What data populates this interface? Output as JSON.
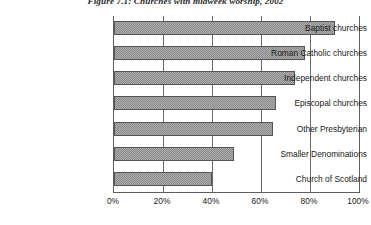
{
  "chart_data": {
    "type": "bar",
    "orientation": "horizontal",
    "title": "Figure 7.1: Churches with midweek worship, 2002",
    "xlabel": "",
    "ylabel": "",
    "xlim": [
      0,
      100
    ],
    "xticks": [
      0,
      20,
      40,
      60,
      80,
      100
    ],
    "xtick_labels": [
      "0%",
      "20%",
      "40%",
      "60%",
      "80%",
      "100%"
    ],
    "grid": true,
    "legend": false,
    "categories": [
      "Baptist churches",
      "Roman Catholic churches",
      "Independent churches",
      "Episcopal churches",
      "Other Presbyterian",
      "Smaller Denominations",
      "Church of Scotland"
    ],
    "values": [
      90,
      78,
      74,
      66,
      65,
      49,
      40
    ],
    "series": [
      {
        "name": "Churches with midweek worship",
        "values": [
          90,
          78,
          74,
          66,
          65,
          49,
          40
        ]
      }
    ],
    "bar_color": "#8a8a8a",
    "bar_edge_color": "#555555",
    "axis_color": "#5e5e5e",
    "background_color": "#ffffff"
  }
}
